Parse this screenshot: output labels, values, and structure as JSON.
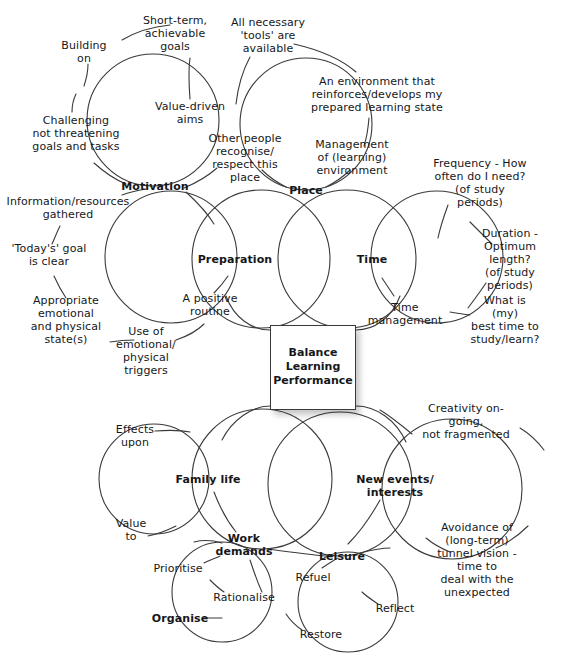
{
  "diagram": {
    "center": {
      "text": "Balance\nLearning\nPerformance",
      "x": 313,
      "y": 367,
      "w": 86,
      "h": 85
    },
    "stroke_color": "#3a3a3a",
    "text_color": "#15171a",
    "background": "#ffffff",
    "hubs": [
      {
        "id": "motivation",
        "label": "Motivation",
        "x": 155,
        "y": 186,
        "circle": {
          "cx": 153,
          "cy": 120,
          "r": 66
        }
      },
      {
        "id": "place",
        "label": "Place",
        "x": 306,
        "y": 190,
        "circle": {
          "cx": 306,
          "cy": 124,
          "r": 66
        }
      },
      {
        "id": "preparation",
        "label": "Preparation",
        "x": 235,
        "y": 259,
        "circle": {
          "cx": 171,
          "cy": 257,
          "r": 66
        }
      },
      {
        "id": "time",
        "label": "Time",
        "x": 372,
        "y": 259,
        "circle": {
          "cx": 437,
          "cy": 257,
          "r": 66
        }
      },
      {
        "id": "family-life",
        "label": "Family life",
        "x": 208,
        "y": 479,
        "circle": {
          "cx": 154,
          "cy": 479,
          "r": 55
        }
      },
      {
        "id": "new-events",
        "label": "New events/\ninterests",
        "x": 395,
        "y": 486,
        "circle": {
          "cx": 452,
          "cy": 489,
          "r": 70
        }
      },
      {
        "id": "work-demands",
        "label": "Work\ndemands",
        "x": 244,
        "y": 545,
        "circle": {
          "cx": 222,
          "cy": 592,
          "r": 50
        }
      },
      {
        "id": "leisure",
        "label": "Leisure",
        "x": 342,
        "y": 556,
        "circle": {
          "cx": 348,
          "cy": 602,
          "r": 50
        }
      }
    ],
    "center_circles": [
      {
        "id": "preparation-inner",
        "cx": 261,
        "cy": 259,
        "r": 69
      },
      {
        "id": "time-inner",
        "cx": 347,
        "cy": 259,
        "r": 69
      },
      {
        "id": "family-inner",
        "cx": 262,
        "cy": 479,
        "r": 70
      },
      {
        "id": "events-inner",
        "cx": 340,
        "cy": 484,
        "r": 72
      }
    ],
    "leaves": [
      {
        "id": "short-term-goals",
        "text": "Short-term,\nachievable\ngoals",
        "x": 175,
        "y": 33,
        "bold": false
      },
      {
        "id": "building-on",
        "text": "Building\non",
        "x": 84,
        "y": 52,
        "bold": false
      },
      {
        "id": "all-tools",
        "text": "All necessary\n'tools' are\navailable",
        "x": 268,
        "y": 35,
        "bold": false
      },
      {
        "id": "environment-reinforce",
        "text": "An environment that\nreinforces/develops my\nprepared learning state",
        "x": 377,
        "y": 94,
        "bold": false
      },
      {
        "id": "value-driven-aims",
        "text": "Value-driven\naims",
        "x": 190,
        "y": 113,
        "bold": false
      },
      {
        "id": "challenging",
        "text": "Challenging\nnot threatening\ngoals and tasks",
        "x": 76,
        "y": 133,
        "bold": false
      },
      {
        "id": "other-people",
        "text": "Other people\nrecognise/\nrespect this\nplace",
        "x": 245,
        "y": 158,
        "bold": false
      },
      {
        "id": "management-env",
        "text": "Management\nof (learning)\nenvironment",
        "x": 352,
        "y": 157,
        "bold": false
      },
      {
        "id": "frequency",
        "text": "Frequency - How\noften do I need?\n(of study periods)",
        "x": 480,
        "y": 183,
        "bold": false
      },
      {
        "id": "info-resources",
        "text": "Information/resources\ngathered",
        "x": 68,
        "y": 208,
        "bold": false
      },
      {
        "id": "todays-goal",
        "text": "'Today's' goal\nis clear",
        "x": 49,
        "y": 255,
        "bold": false
      },
      {
        "id": "duration",
        "text": "Duration -\nOptimum length?\n(of study\nperiods)",
        "x": 510,
        "y": 259,
        "bold": false
      },
      {
        "id": "appropriate-state",
        "text": "Appropriate\nemotional\nand physical\nstate(s)",
        "x": 66,
        "y": 320,
        "bold": false
      },
      {
        "id": "positive-routine",
        "text": "A positive\nroutine",
        "x": 210,
        "y": 305,
        "bold": false
      },
      {
        "id": "time-management",
        "text": "Time\nmanagement",
        "x": 405,
        "y": 314,
        "bold": false
      },
      {
        "id": "best-time",
        "text": "What is (my)\nbest time to\nstudy/learn?",
        "x": 505,
        "y": 320,
        "bold": false
      },
      {
        "id": "use-of-triggers",
        "text": "Use of\nemotional/\nphysical\ntriggers",
        "x": 146,
        "y": 351,
        "bold": false
      },
      {
        "id": "creativity",
        "text": "Creativity on-going,\nnot fragmented",
        "x": 466,
        "y": 421,
        "bold": false
      },
      {
        "id": "effects-upon",
        "text": "Effects\nupon",
        "x": 135,
        "y": 436,
        "bold": false
      },
      {
        "id": "value-to",
        "text": "Value\nto",
        "x": 131,
        "y": 530,
        "bold": false
      },
      {
        "id": "avoidance",
        "text": "Avoidance of\n(long-term)\ntunnel vision - time to\ndeal with the unexpected",
        "x": 477,
        "y": 560,
        "bold": false
      },
      {
        "id": "prioritise",
        "text": "Prioritise",
        "x": 178,
        "y": 568,
        "bold": false
      },
      {
        "id": "refuel",
        "text": "Refuel",
        "x": 313,
        "y": 577,
        "bold": false
      },
      {
        "id": "rationalise",
        "text": "Rationalise",
        "x": 244,
        "y": 597,
        "bold": false
      },
      {
        "id": "reflect",
        "text": "Reflect",
        "x": 395,
        "y": 608,
        "bold": false
      },
      {
        "id": "organise",
        "text": "Organise",
        "x": 180,
        "y": 618,
        "bold": true
      },
      {
        "id": "restore",
        "text": "Restore",
        "x": 321,
        "y": 634,
        "bold": false
      }
    ],
    "connectors": [
      {
        "id": "c-shortterm-arc",
        "d": "M 122 40 C 142 28 160 26 170 25"
      },
      {
        "id": "c-building-stem",
        "d": "M 88 64 C 88 72 86 80 84 86"
      },
      {
        "id": "c-valuedriven-1",
        "d": "M 190 58 C 188 72 189 86 190 99"
      },
      {
        "id": "c-tools-stem",
        "d": "M 250 57 C 243 70 238 86 236 104"
      },
      {
        "id": "c-env-arc",
        "d": "M 294 44 C 320 50 340 58 356 72"
      },
      {
        "id": "c-env-stem",
        "d": "M 369 118 C 368 130 366 140 364 146"
      },
      {
        "id": "c-challenge-stem",
        "d": "M 72 112 C 72 104 74 98 76 94"
      },
      {
        "id": "c-motiv-left",
        "d": "M 94 163 C 104 172 116 180 126 184"
      },
      {
        "id": "c-motiv-right",
        "d": "M 184 188 C 196 183 208 176 217 168"
      },
      {
        "id": "c-motiv-down",
        "d": "M 186 192 C 198 203 208 214 214 224"
      },
      {
        "id": "c-info-stem",
        "d": "M 122 195 C 130 192 140 190 146 189"
      },
      {
        "id": "c-place-left",
        "d": "M 286 187 C 276 182 268 176 262 170"
      },
      {
        "id": "c-place-right",
        "d": "M 326 187 C 336 182 344 176 350 170"
      },
      {
        "id": "c-freq-stem",
        "d": "M 448 205 C 444 216 440 228 438 238"
      },
      {
        "id": "c-todays-stem",
        "d": "M 60 226 C 56 234 54 240 52 244"
      },
      {
        "id": "c-todays-down",
        "d": "M 54 276 C 58 285 62 292 66 298"
      },
      {
        "id": "c-duration-stem",
        "d": "M 470 222 C 478 230 486 238 492 244"
      },
      {
        "id": "c-duration-down",
        "d": "M 486 283 C 480 292 474 300 468 308"
      },
      {
        "id": "c-prep-leaf",
        "d": "M 214 293 C 219 288 224 282 228 276"
      },
      {
        "id": "c-useof-arc",
        "d": "M 110 342 C 122 340 130 340 134 340"
      },
      {
        "id": "c-useof-right",
        "d": "M 176 340 C 188 336 198 330 204 324"
      },
      {
        "id": "c-timemgmt-stem",
        "d": "M 394 296 C 390 290 386 284 382 278"
      },
      {
        "id": "c-besttime-stem",
        "d": "M 470 315 C 462 314 456 313 450 312"
      },
      {
        "id": "c-creativity-arc",
        "d": "M 412 434 C 400 424 390 416 380 410"
      },
      {
        "id": "c-creativity-r",
        "d": "M 520 428 C 530 434 538 442 544 450"
      },
      {
        "id": "c-effects-stem",
        "d": "M 155 431 C 168 430 180 430 190 432"
      },
      {
        "id": "c-valueto-stem",
        "d": "M 148 536 C 158 534 168 530 176 526"
      },
      {
        "id": "c-family-down",
        "d": "M 214 492 C 220 508 228 522 236 532"
      },
      {
        "id": "c-events-down",
        "d": "M 380 500 C 370 518 358 534 348 544"
      },
      {
        "id": "c-work-left",
        "d": "M 222 543 C 212 540 202 540 194 542"
      },
      {
        "id": "c-work-right",
        "d": "M 268 549 C 290 552 312 555 326 556"
      },
      {
        "id": "c-work-down",
        "d": "M 250 560 C 254 572 258 584 262 592"
      },
      {
        "id": "c-prior-stem",
        "d": "M 204 563 C 210 560 216 558 220 556"
      },
      {
        "id": "c-refuel-stem",
        "d": "M 322 568 C 328 564 334 560 338 558"
      },
      {
        "id": "c-leisure-right",
        "d": "M 360 553 C 372 550 382 548 390 548"
      },
      {
        "id": "c-avoid-right",
        "d": "M 496 548 C 510 542 520 534 528 526"
      },
      {
        "id": "c-avoid-left",
        "d": "M 450 552 C 440 548 432 543 426 538"
      },
      {
        "id": "c-reflect-stem",
        "d": "M 378 604 C 372 600 366 596 362 592"
      },
      {
        "id": "c-restore-stem",
        "d": "M 302 630 C 296 626 290 620 286 614"
      },
      {
        "id": "c-organise-stem",
        "d": "M 204 618 C 212 618 218 618 222 618"
      },
      {
        "id": "c-rationalise-st",
        "d": "M 224 592 C 218 588 214 584 210 580"
      }
    ],
    "box_connectors": [
      {
        "id": "b-prep-box",
        "d": "M 270 330 C 252 330 234 318 226 296"
      },
      {
        "id": "b-time-box",
        "d": "M 356 330 C 374 330 392 318 400 296"
      },
      {
        "id": "b-family-box",
        "d": "M 270 406 C 252 406 232 420 222 440"
      },
      {
        "id": "b-events-box",
        "d": "M 356 406 C 376 406 396 420 406 442"
      }
    ]
  }
}
